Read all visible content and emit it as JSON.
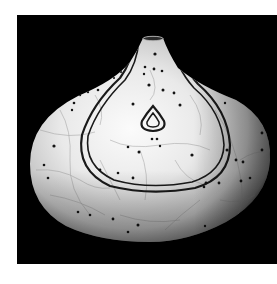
{
  "image": {
    "alt": "Black and white photograph of a squat onion-shaped raku ceramic vase with white crackle glaze, a double-line teardrop band descending from the narrow neck, a small nested teardrop motif in the center, and scattered black dots, on a black background",
    "subject": "raku ceramic vase",
    "background": "black",
    "page_background": "white",
    "colors": {
      "page": "#ffffff",
      "backdrop": "#000000",
      "glaze_light": "#f2f2f2",
      "glaze_mid": "#cfcfcf",
      "glaze_shadow": "#8a8a8a",
      "line_ink": "#1a1a1a"
    },
    "motifs": [
      "narrow-neck-opening",
      "double-line-teardrop-band",
      "nested-teardrop-center",
      "black-dot-pattern",
      "crackle-glaze-lines"
    ]
  }
}
